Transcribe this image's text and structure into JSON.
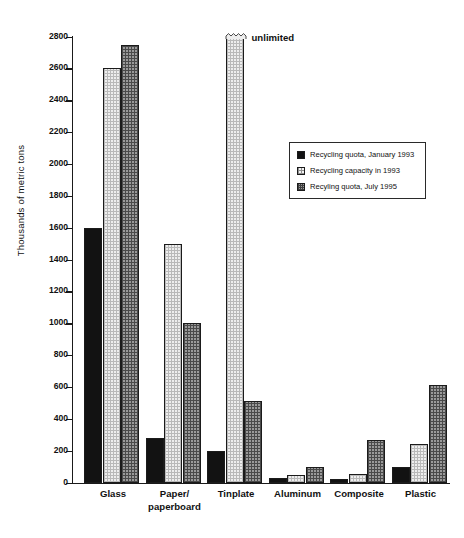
{
  "chart_data": {
    "type": "bar",
    "title": "",
    "xlabel": "",
    "ylabel": "Thousands of metric tons",
    "ylim": [
      0,
      2800
    ],
    "ytick_step": 200,
    "yticks": [
      0,
      200,
      400,
      600,
      800,
      1000,
      1200,
      1400,
      1600,
      1800,
      2000,
      2200,
      2400,
      2600,
      2800
    ],
    "ytick_labels": [
      "0",
      "200",
      "400",
      "600",
      "800",
      "1000",
      "1200",
      "1400",
      "1600",
      "1800",
      "2000",
      "2200",
      "2400",
      "2600",
      "2800"
    ],
    "grid": false,
    "legend_position": "upper-right-inside",
    "categories": [
      "Glass",
      "Paper/\npaperboard",
      "Tinplate",
      "Aluminum",
      "Composite",
      "Plastic"
    ],
    "series": [
      {
        "name": "Recycling quota, January 1993",
        "fill": "solid-black",
        "values": [
          1600,
          280,
          200,
          30,
          25,
          100
        ]
      },
      {
        "name": "Recycling capacity in 1993",
        "fill": "light-stipple",
        "values": [
          2600,
          1500,
          2800,
          50,
          55,
          240
        ],
        "value_notes": [
          null,
          null,
          "unlimited",
          null,
          null,
          null
        ]
      },
      {
        "name": "Recyling quota, July 1995",
        "fill": "dark-crosshatch",
        "values": [
          2750,
          1000,
          510,
          100,
          270,
          610
        ]
      }
    ],
    "annotations": [
      {
        "text": "unlimited",
        "category": "Tinplate",
        "series": "Recycling capacity in 1993"
      }
    ],
    "colors": {
      "axis": "#1a1a1a",
      "series_solid": "#121212",
      "series_light": "#eeeeee",
      "series_dark": "#9a9a9a",
      "background": "#ffffff"
    }
  }
}
